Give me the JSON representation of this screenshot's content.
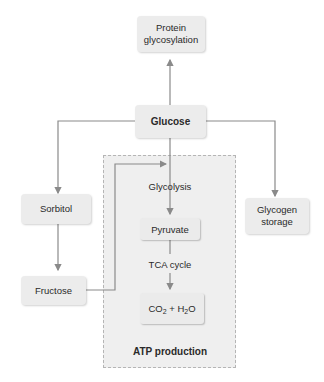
{
  "diagram": {
    "nodes": {
      "protein_glycosylation": "Protein glycosylation",
      "glucose": "Glucose",
      "sorbitol": "Sorbitol",
      "fructose": "Fructose",
      "glycogen_storage": "Glycogen storage",
      "pyruvate": "Pyruvate",
      "co2_h2o": {
        "part1": "CO",
        "sub1": "2",
        "mid": " + H",
        "sub2": "2",
        "part2": "O"
      }
    },
    "edge_labels": {
      "glycolysis": "Glycolysis",
      "tca_cycle": "TCA cycle"
    },
    "group_label": "ATP production",
    "edges": [
      {
        "from": "glucose",
        "to": "protein_glycosylation"
      },
      {
        "from": "glucose",
        "to": "sorbitol"
      },
      {
        "from": "glucose",
        "to": "glycogen_storage"
      },
      {
        "from": "glucose",
        "to": "pyruvate",
        "label": "Glycolysis"
      },
      {
        "from": "sorbitol",
        "to": "fructose"
      },
      {
        "from": "fructose",
        "to": "glycolysis"
      },
      {
        "from": "pyruvate",
        "to": "co2_h2o",
        "label": "TCA cycle"
      }
    ],
    "colors": {
      "line": "#8a8a8a",
      "node_fill": "#ececec",
      "group_fill": "#efefef",
      "group_border": "#b5b5b5"
    }
  }
}
